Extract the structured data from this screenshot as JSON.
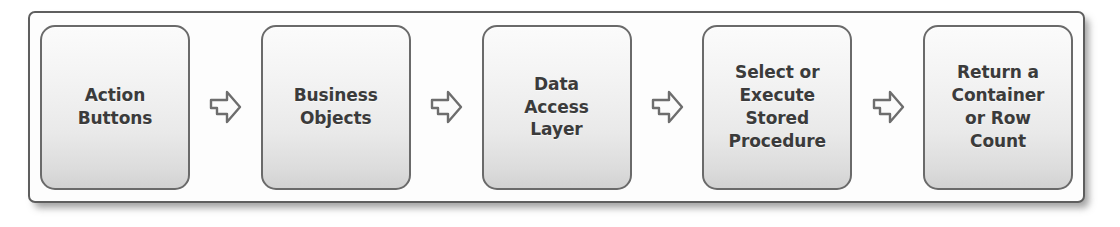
{
  "diagram": {
    "frame": {
      "border_color": "#5e5e5e",
      "background_color": "#fdfdfd"
    },
    "style": {
      "node_border_color": "#6a6a6a",
      "node_fill_top": "#fbfbfb",
      "node_fill_bottom": "#d2d2d2",
      "text_color": "#3b3b3b",
      "arrow_outline_color": "#6d6d6d",
      "arrow_fill_color": "#fbfbfb"
    },
    "nodes": [
      {
        "id": "action-buttons",
        "label": "Action\nButtons"
      },
      {
        "id": "business-objects",
        "label": "Business\nObjects"
      },
      {
        "id": "data-access-layer",
        "label": "Data\nAccess\nLayer"
      },
      {
        "id": "select-execute",
        "label": "Select or\nExecute\nStored\nProcedure"
      },
      {
        "id": "return-container",
        "label": "Return a\nContainer\nor Row\nCount"
      }
    ],
    "arrows": [
      {
        "id": "arrow-1",
        "from": "action-buttons",
        "to": "business-objects",
        "direction": "right"
      },
      {
        "id": "arrow-2",
        "from": "business-objects",
        "to": "data-access-layer",
        "direction": "right"
      },
      {
        "id": "arrow-3",
        "from": "data-access-layer",
        "to": "select-execute",
        "direction": "right"
      },
      {
        "id": "arrow-4",
        "from": "select-execute",
        "to": "return-container",
        "direction": "right"
      }
    ]
  }
}
